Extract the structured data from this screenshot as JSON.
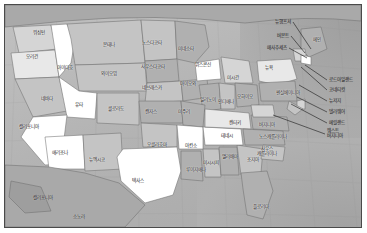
{
  "figure": {
    "frame_color": "#4a4a4a",
    "ocean_color": "#b4b4b4",
    "land_colors": [
      "#ffffff",
      "#e8e8e8",
      "#d5d5d5",
      "#c4c4c4",
      "#b0b0b0",
      "#9e9e9e"
    ],
    "label_color": "#1a1a1a",
    "border_color": "#3a3a3a"
  },
  "map_data": {
    "type": "choropleth",
    "projection": "conic",
    "region": "미국 본토",
    "label_language": "ko",
    "states": [
      {
        "name": "워싱턴",
        "en": "Washington",
        "x": 34,
        "y": 28,
        "fill": "#d5d5d5",
        "leader": false
      },
      {
        "name": "오리건",
        "en": "Oregon",
        "x": 27,
        "y": 52,
        "fill": "#e8e8e8",
        "leader": false
      },
      {
        "name": "아이다호",
        "en": "Idaho",
        "x": 60,
        "y": 63,
        "fill": "#ffffff",
        "leader": false
      },
      {
        "name": "몬태나",
        "en": "Montana",
        "x": 104,
        "y": 40,
        "fill": "#c4c4c4",
        "leader": false
      },
      {
        "name": "노스다코타",
        "en": "North Dakota",
        "x": 147,
        "y": 38,
        "fill": "#c4c4c4",
        "leader": false
      },
      {
        "name": "미네소타",
        "en": "Minnesota",
        "x": 181,
        "y": 44,
        "fill": "#b0b0b0",
        "leader": false
      },
      {
        "name": "사우스다코타",
        "en": "South Dakota",
        "x": 148,
        "y": 62,
        "fill": "#b0b0b0",
        "leader": false
      },
      {
        "name": "와이오밍",
        "en": "Wyoming",
        "x": 104,
        "y": 69,
        "fill": "#c4c4c4",
        "leader": false
      },
      {
        "name": "네바다",
        "en": "Nevada",
        "x": 42,
        "y": 94,
        "fill": "#c4c4c4",
        "leader": false
      },
      {
        "name": "유타",
        "en": "Utah",
        "x": 74,
        "y": 100,
        "fill": "#ffffff",
        "leader": false
      },
      {
        "name": "콜로라도",
        "en": "Colorado",
        "x": 111,
        "y": 104,
        "fill": "#c4c4c4",
        "leader": false
      },
      {
        "name": "네브래스카",
        "en": "Nebraska",
        "x": 147,
        "y": 83,
        "fill": "#c4c4c4",
        "leader": false
      },
      {
        "name": "아이오와",
        "en": "Iowa",
        "x": 183,
        "y": 79,
        "fill": "#b0b0b0",
        "leader": false
      },
      {
        "name": "위스콘신",
        "en": "Wisconsin",
        "x": 198,
        "y": 60,
        "fill": "#ffffff",
        "leader": false
      },
      {
        "name": "미시간",
        "en": "Michigan",
        "x": 228,
        "y": 73,
        "fill": "#d5d5d5",
        "leader": false
      },
      {
        "name": "일리노이",
        "en": "Illinois",
        "x": 203,
        "y": 95,
        "fill": "#b0b0b0",
        "leader": false
      },
      {
        "name": "인디애나",
        "en": "Indiana",
        "x": 221,
        "y": 97,
        "fill": "#c4c4c4",
        "leader": false
      },
      {
        "name": "오하이오",
        "en": "Ohio",
        "x": 240,
        "y": 92,
        "fill": "#b0b0b0",
        "leader": false
      },
      {
        "name": "캔자스",
        "en": "Kansas",
        "x": 146,
        "y": 107,
        "fill": "#b0b0b0",
        "leader": false
      },
      {
        "name": "미주리",
        "en": "Missouri",
        "x": 179,
        "y": 107,
        "fill": "#b0b0b0",
        "leader": false
      },
      {
        "name": "캘리포니아",
        "en": "California",
        "x": 24,
        "y": 122,
        "fill": "#ffffff",
        "leader": false
      },
      {
        "name": "애리조나",
        "en": "Arizona",
        "x": 55,
        "y": 148,
        "fill": "#ffffff",
        "leader": false
      },
      {
        "name": "뉴멕시코",
        "en": "New Mexico",
        "x": 92,
        "y": 155,
        "fill": "#c4c4c4",
        "leader": false
      },
      {
        "name": "오클라호마",
        "en": "Oklahoma",
        "x": 152,
        "y": 140,
        "fill": "#c4c4c4",
        "leader": false
      },
      {
        "name": "아칸소",
        "en": "Arkansas",
        "x": 186,
        "y": 141,
        "fill": "#ffffff",
        "leader": false
      },
      {
        "name": "텍사스",
        "en": "Texas",
        "x": 133,
        "y": 176,
        "fill": "#ffffff",
        "leader": false
      },
      {
        "name": "루이지애나",
        "en": "Louisiana",
        "x": 191,
        "y": 165,
        "fill": "#b0b0b0",
        "leader": false
      },
      {
        "name": "미시시피",
        "en": "Mississippi",
        "x": 206,
        "y": 158,
        "fill": "#c4c4c4",
        "leader": false
      },
      {
        "name": "앨라배마",
        "en": "Alabama",
        "x": 225,
        "y": 152,
        "fill": "#b0b0b0",
        "leader": false
      },
      {
        "name": "조지아",
        "en": "Georgia",
        "x": 248,
        "y": 155,
        "fill": "#c4c4c4",
        "leader": false
      },
      {
        "name": "플로리다",
        "en": "Florida",
        "x": 256,
        "y": 202,
        "fill": "#b0b0b0",
        "leader": false
      },
      {
        "name": "테네시",
        "en": "Tennessee",
        "x": 222,
        "y": 131,
        "fill": "#ffffff",
        "leader": false
      },
      {
        "name": "켄터키",
        "en": "Kentucky",
        "x": 230,
        "y": 118,
        "fill": "#e8e8e8",
        "leader": false
      },
      {
        "name": "노스캐롤라이나",
        "en": "North Carolina",
        "x": 268,
        "y": 132,
        "fill": "#b0b0b0",
        "leader": false
      },
      {
        "name": "사우스\n캐롤라이나",
        "en": "South Carolina",
        "x": 262,
        "y": 147,
        "fill": "#c4c4c4",
        "leader": false
      },
      {
        "name": "버지니아",
        "en": "Virginia",
        "x": 262,
        "y": 120,
        "fill": "#b0b0b0",
        "leader": false
      },
      {
        "name": "뉴욕",
        "en": "New York",
        "x": 264,
        "y": 63,
        "fill": "#e8e8e8",
        "leader": false
      },
      {
        "name": "펜실베이니아",
        "en": "Pennsylvania",
        "x": 283,
        "y": 88,
        "fill": "#b0b0b0",
        "leader": false
      },
      {
        "name": "메인",
        "en": "Maine",
        "x": 312,
        "y": 35,
        "fill": "#b0b0b0",
        "leader": false
      },
      {
        "name": "뉴햄프셔",
        "en": "New Hampshire",
        "x": 290,
        "y": 17,
        "fill": "#b0b0b0",
        "leader": true,
        "lx": 288,
        "ly": 17,
        "tx": 306,
        "ty": 44
      },
      {
        "name": "버몬트",
        "en": "Vermont",
        "x": 288,
        "y": 31,
        "fill": "#b0b0b0",
        "leader": true,
        "lx": 286,
        "ly": 31,
        "tx": 300,
        "ty": 48
      },
      {
        "name": "매사추세츠",
        "en": "Massachusetts",
        "x": 291,
        "y": 43,
        "fill": "#b0b0b0",
        "leader": true,
        "lx": 284,
        "ly": 43,
        "tx": 302,
        "ty": 53
      },
      {
        "name": "로드아일랜드",
        "en": "Rhode Island",
        "x": 324,
        "y": 75,
        "fill": "#b0b0b0",
        "leader": true,
        "lx": 322,
        "ly": 75,
        "tx": 300,
        "ty": 60
      },
      {
        "name": "코네티컷",
        "en": "Connecticut",
        "x": 324,
        "y": 85,
        "fill": "#b0b0b0",
        "leader": true,
        "lx": 322,
        "ly": 85,
        "tx": 296,
        "ty": 62
      },
      {
        "name": "뉴저지",
        "en": "New Jersey",
        "x": 324,
        "y": 96,
        "fill": "#b0b0b0",
        "leader": true,
        "lx": 322,
        "ly": 96,
        "tx": 294,
        "ty": 80
      },
      {
        "name": "델라웨어",
        "en": "Delaware",
        "x": 324,
        "y": 107,
        "fill": "#b0b0b0",
        "leader": true,
        "lx": 322,
        "ly": 107,
        "tx": 292,
        "ty": 92
      },
      {
        "name": "메릴랜드",
        "en": "Maryland",
        "x": 324,
        "y": 118,
        "fill": "#b0b0b0",
        "leader": true,
        "lx": 322,
        "ly": 118,
        "tx": 286,
        "ty": 99
      },
      {
        "name": "웨스트\n버지니아",
        "en": "West Virginia",
        "x": 322,
        "y": 131,
        "fill": "#b0b0b0",
        "leader": true,
        "lx": 320,
        "ly": 129,
        "tx": 268,
        "ty": 110
      }
    ],
    "neighbors": [
      {
        "name": "캘리포니아",
        "en": "Baja California",
        "x": 38,
        "y": 192
      },
      {
        "name": "소노라",
        "en": "Sonora",
        "x": 74,
        "y": 211
      }
    ]
  }
}
